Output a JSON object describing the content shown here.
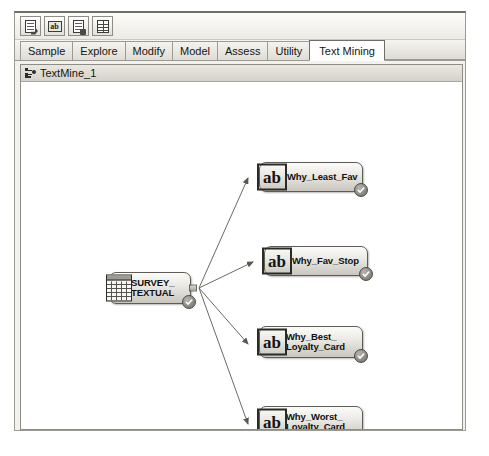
{
  "window": {
    "toolbar": {
      "buttons": [
        {
          "name": "create-data-source-button",
          "icon": "page-arrow-icon",
          "tooltip": "Create Data Source"
        },
        {
          "name": "text-miner-button",
          "icon": "ab-icon",
          "tooltip": "Text Miner"
        },
        {
          "name": "text-parsing-button",
          "icon": "page-plus-icon",
          "tooltip": "Text Parsing"
        },
        {
          "name": "text-topic-button",
          "icon": "grid-page-icon",
          "tooltip": "Text Topic"
        }
      ]
    },
    "tabs": [
      {
        "label": "Sample",
        "active": false
      },
      {
        "label": "Explore",
        "active": false
      },
      {
        "label": "Modify",
        "active": false
      },
      {
        "label": "Model",
        "active": false
      },
      {
        "label": "Assess",
        "active": false
      },
      {
        "label": "Utility",
        "active": false
      },
      {
        "label": "Text Mining",
        "active": true
      }
    ],
    "diagram": {
      "title": "TextMine_1",
      "title_icon": "diagram-icon",
      "nodes": [
        {
          "id": "source",
          "label": "SURVEY_\nTEXTUAL",
          "icon": "data-table-icon",
          "type": "data-source",
          "status": "complete",
          "x": 88,
          "y": 190,
          "w": 82,
          "h": 32
        },
        {
          "id": "node1",
          "label": "Why_Least_Fav",
          "icon": "ab-icon",
          "type": "text-parsing",
          "status": "complete",
          "x": 238,
          "y": 80,
          "w": 104,
          "h": 30
        },
        {
          "id": "node2",
          "label": "Why_Fav_Stop",
          "icon": "ab-icon",
          "type": "text-parsing",
          "status": "complete",
          "x": 243,
          "y": 164,
          "w": 104,
          "h": 30
        },
        {
          "id": "node3",
          "label": "Why_Best_\nLoyalty_Card",
          "icon": "ab-icon",
          "type": "text-parsing",
          "status": "complete",
          "x": 238,
          "y": 244,
          "w": 104,
          "h": 32
        },
        {
          "id": "node4",
          "label": "Why_Worst_\nLoyalty_Card",
          "icon": "ab-icon",
          "type": "text-parsing",
          "status": "complete",
          "x": 238,
          "y": 324,
          "w": 104,
          "h": 32
        }
      ],
      "connections": [
        {
          "from": "source",
          "to": "node1"
        },
        {
          "from": "source",
          "to": "node2"
        },
        {
          "from": "source",
          "to": "node3"
        },
        {
          "from": "source",
          "to": "node4"
        }
      ]
    }
  },
  "colors": {
    "node_border": "#5d5d58",
    "connector": "#6a6a63",
    "badge": "#6f6d67",
    "window_chrome": "#f2f1ec",
    "canvas": "#ffffff"
  }
}
